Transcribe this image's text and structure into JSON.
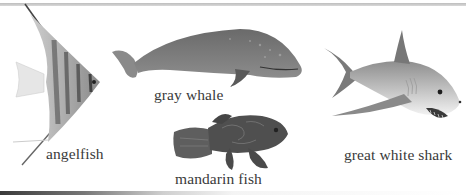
{
  "animals": [
    {
      "id": "angelfish",
      "label": "angelfish"
    },
    {
      "id": "gray-whale",
      "label": "gray whale"
    },
    {
      "id": "mandarin-fish",
      "label": "mandarin fish"
    },
    {
      "id": "great-white-shark",
      "label": "great white shark"
    }
  ],
  "colors": {
    "background": "#ffffff",
    "text": "#3a3a3a",
    "rule": "#c8c8c8"
  }
}
